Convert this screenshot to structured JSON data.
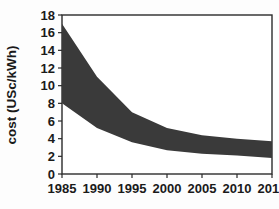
{
  "chart_data": {
    "type": "area",
    "title": "",
    "xlabel": "",
    "ylabel": "cost (USc/kWh)",
    "xlim": [
      1985,
      2015
    ],
    "ylim": [
      0,
      18
    ],
    "grid": false,
    "legend": "none",
    "x_ticks": [
      "1985",
      "1990",
      "1995",
      "2000",
      "2005",
      "2010",
      "2015"
    ],
    "y_ticks": [
      "0",
      "2",
      "4",
      "6",
      "8",
      "10",
      "12",
      "14",
      "16",
      "18"
    ],
    "x": [
      1985,
      1990,
      1995,
      2000,
      2005,
      2010,
      2015
    ],
    "band_fill_color": "#3a3a3a",
    "series": [
      {
        "name": "upper bound",
        "values": [
          17.0,
          11.0,
          7.0,
          5.2,
          4.4,
          4.0,
          3.7
        ]
      },
      {
        "name": "lower bound",
        "values": [
          8.0,
          5.2,
          3.6,
          2.7,
          2.3,
          2.1,
          1.8
        ]
      }
    ]
  },
  "axis": {
    "y_label": "cost (USc/kWh)"
  }
}
